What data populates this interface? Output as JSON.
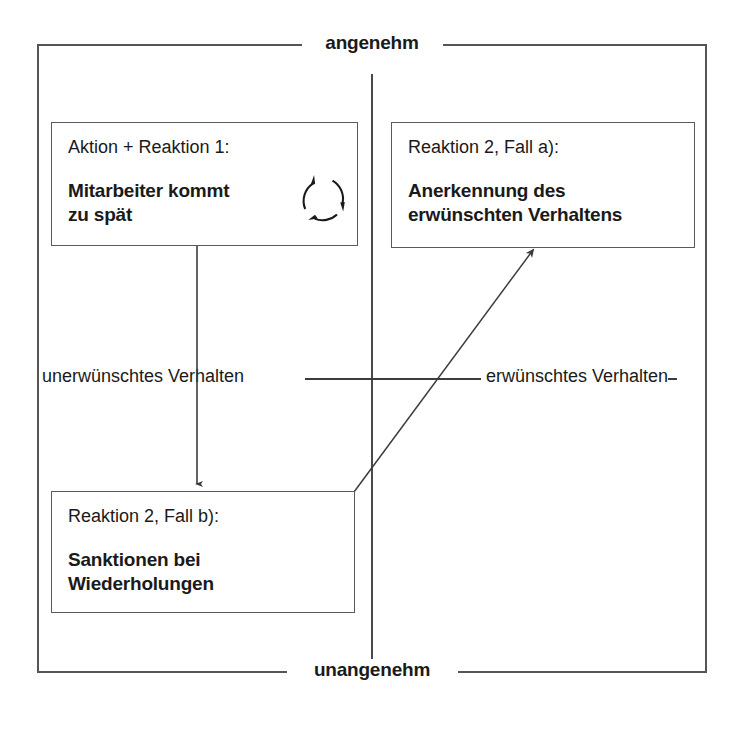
{
  "diagram": {
    "type": "behaviour-quadrant-diagram",
    "axes": {
      "top_label": "angenehm",
      "bottom_label": "unangenehm",
      "left_label": "unerwünschtes Verhalten",
      "right_label": "erwünschtes Verhalten"
    },
    "boxes": [
      {
        "id": "action-reaction-1",
        "title": "Aktion + Reaktion 1:",
        "body_line_1": "Mitarbeiter kommt",
        "body_line_2": "zu spät",
        "icon": "cycle-arrows-icon",
        "quadrant": "top-left"
      },
      {
        "id": "reaction-2-case-a",
        "title": "Reaktion 2, Fall a):",
        "body_line_1": "Anerkennung des",
        "body_line_2": "erwünschten Verhaltens",
        "quadrant": "top-right"
      },
      {
        "id": "reaction-2-case-b",
        "title": "Reaktion 2, Fall b):",
        "body_line_1": "Sanktionen bei",
        "body_line_2": "Wiederholungen",
        "quadrant": "bottom-left"
      }
    ],
    "connectors": [
      {
        "id": "arrow-down-to-reaction-2b",
        "from": "action-reaction-1",
        "to": "reaction-2-case-b",
        "style": "straight-vertical-arrow"
      },
      {
        "id": "arrow-diagonal-to-reaction-2a",
        "from": "reaction-2-case-b",
        "to": "reaction-2-case-a",
        "style": "diagonal-arrow"
      }
    ],
    "colors": {
      "stroke": "#4a4a4a",
      "box_border": "#5a5a5a",
      "text": "#1a1a1a",
      "background": "#ffffff"
    }
  }
}
